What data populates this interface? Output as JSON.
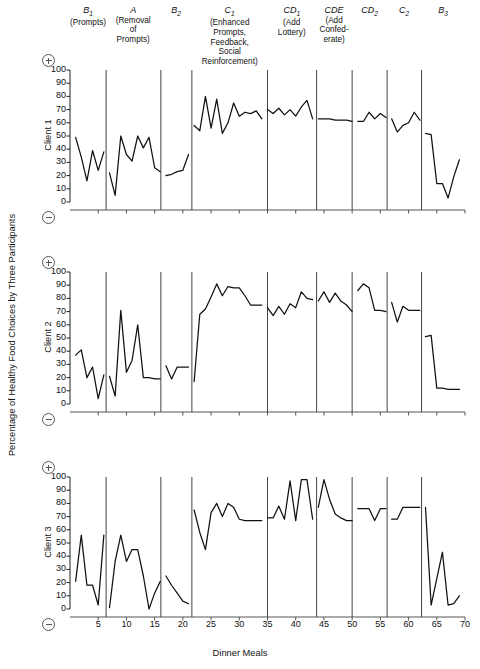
{
  "axes": {
    "ylabel": "Percentage of Healthy Food Choices by Three Participants",
    "xlabel": "Dinner Meals",
    "yticks": [
      0,
      10,
      20,
      30,
      40,
      50,
      60,
      70,
      80,
      90,
      100
    ],
    "xticks": [
      5,
      10,
      15,
      20,
      25,
      30,
      35,
      40,
      45,
      50,
      55,
      60,
      65,
      70
    ],
    "xlim": [
      0,
      70
    ],
    "ylim": [
      0,
      100
    ],
    "positive_symbol": "plus-in-circle",
    "negative_symbol": "minus-in-circle"
  },
  "phases": [
    {
      "code": "B",
      "sub": "1",
      "desc": "(Prompts)",
      "center_x": 3.2,
      "end_x": 6.4
    },
    {
      "code": "A",
      "sub": "",
      "desc": "(Removal\nof\nPrompts)",
      "center_x": 11.2,
      "end_x": 16.1
    },
    {
      "code": "B",
      "sub": "2",
      "desc": "",
      "center_x": 18.8,
      "end_x": 21.6
    },
    {
      "code": "C",
      "sub": "1",
      "desc": "(Enhanced\nPrompts,\nFeedback,\nSocial\nReinforcement)",
      "center_x": 28.3,
      "end_x": 35.0
    },
    {
      "code": "CD",
      "sub": "1",
      "desc": "(Add\nLottery)",
      "center_x": 39.3,
      "end_x": 43.7
    },
    {
      "code": "CDE",
      "sub": "",
      "desc": "(Add\nConfed-\nerate)",
      "center_x": 46.8,
      "end_x": 50.0
    },
    {
      "code": "CD",
      "sub": "2",
      "desc": "",
      "center_x": 53.1,
      "end_x": 56.2
    },
    {
      "code": "C",
      "sub": "2",
      "desc": "",
      "center_x": 59.2,
      "end_x": 62.3
    },
    {
      "code": "B",
      "sub": "3",
      "desc": "",
      "center_x": 66.1,
      "end_x": 70.0
    }
  ],
  "chart_data": [
    {
      "type": "line",
      "title": "Client 1",
      "xlabel": "Dinner Meals",
      "ylabel": "Percentage of Healthy Food Choices",
      "xlim": [
        0,
        70
      ],
      "ylim": [
        0,
        100
      ],
      "grid": false,
      "segments": [
        {
          "phase": "B1",
          "x": [
            1,
            2,
            3,
            4,
            5,
            6
          ],
          "y": [
            49,
            34,
            16,
            39,
            24,
            38
          ]
        },
        {
          "phase": "A",
          "x": [
            7,
            8,
            9,
            10,
            11,
            12,
            13,
            14,
            15,
            16
          ],
          "y": [
            22,
            5,
            50,
            36,
            31,
            50,
            41,
            49,
            26,
            23
          ]
        },
        {
          "phase": "B2",
          "x": [
            17,
            18,
            19,
            20,
            21
          ],
          "y": [
            20,
            21,
            23,
            24,
            36
          ]
        },
        {
          "phase": "C1",
          "x": [
            22,
            23,
            24,
            25,
            26,
            27,
            28,
            29,
            30,
            31,
            32,
            33,
            34
          ],
          "y": [
            58,
            54,
            80,
            56,
            78,
            52,
            60,
            75,
            65,
            68,
            67,
            69,
            63
          ]
        },
        {
          "phase": "CD1",
          "x": [
            35,
            36,
            37,
            38,
            39,
            40,
            41,
            42,
            43
          ],
          "y": [
            70,
            67,
            71,
            66,
            70,
            65,
            72,
            77,
            63
          ]
        },
        {
          "phase": "CDE",
          "x": [
            44,
            45,
            46,
            47,
            48,
            49,
            50
          ],
          "y": [
            63,
            63,
            63,
            62,
            62,
            62,
            61
          ]
        },
        {
          "phase": "CD2",
          "x": [
            51,
            52,
            53,
            54,
            55,
            56
          ],
          "y": [
            61,
            61,
            68,
            63,
            67,
            64
          ]
        },
        {
          "phase": "C2",
          "x": [
            57,
            58,
            59,
            60,
            61,
            62
          ],
          "y": [
            63,
            53,
            58,
            60,
            68,
            62
          ]
        },
        {
          "phase": "B3",
          "x": [
            63,
            64,
            65,
            66,
            67,
            68,
            69
          ],
          "y": [
            52,
            51,
            14,
            14,
            3,
            19,
            32
          ]
        }
      ]
    },
    {
      "type": "line",
      "title": "Client 2",
      "xlabel": "Dinner Meals",
      "ylabel": "Percentage of Healthy Food Choices",
      "xlim": [
        0,
        70
      ],
      "ylim": [
        0,
        100
      ],
      "grid": false,
      "segments": [
        {
          "phase": "B1",
          "x": [
            1,
            2,
            3,
            4,
            5,
            6
          ],
          "y": [
            37,
            41,
            20,
            28,
            4,
            22
          ]
        },
        {
          "phase": "A",
          "x": [
            7,
            8,
            9,
            10,
            11,
            12,
            13,
            14,
            15,
            16
          ],
          "y": [
            21,
            6,
            71,
            24,
            33,
            60,
            20,
            20,
            19,
            19
          ]
        },
        {
          "phase": "B2",
          "x": [
            17,
            18,
            19,
            20,
            21
          ],
          "y": [
            29,
            19,
            28,
            28,
            28
          ]
        },
        {
          "phase": "C1",
          "x": [
            22,
            23,
            24,
            25,
            26,
            27,
            28,
            29,
            30,
            31,
            32,
            33,
            34
          ],
          "y": [
            17,
            68,
            72,
            81,
            91,
            82,
            89,
            88,
            88,
            82,
            75,
            75,
            75
          ]
        },
        {
          "phase": "CD1",
          "x": [
            35,
            36,
            37,
            38,
            39,
            40,
            41,
            42,
            43
          ],
          "y": [
            73,
            67,
            74,
            68,
            76,
            73,
            85,
            80,
            79
          ]
        },
        {
          "phase": "CDE",
          "x": [
            44,
            45,
            46,
            47,
            48,
            49,
            50
          ],
          "y": [
            78,
            85,
            77,
            84,
            78,
            75,
            70
          ]
        },
        {
          "phase": "CD2",
          "x": [
            51,
            52,
            53,
            54,
            55,
            56
          ],
          "y": [
            86,
            91,
            88,
            71,
            71,
            70
          ]
        },
        {
          "phase": "C2",
          "x": [
            57,
            58,
            59,
            60,
            61,
            62
          ],
          "y": [
            77,
            62,
            74,
            71,
            71,
            71
          ]
        },
        {
          "phase": "B3",
          "x": [
            63,
            64,
            65,
            66,
            67,
            68,
            69
          ],
          "y": [
            51,
            52,
            12,
            12,
            11,
            11,
            11
          ]
        }
      ]
    },
    {
      "type": "line",
      "title": "Client 3",
      "xlabel": "Dinner Meals",
      "ylabel": "Percentage of Healthy Food Choices",
      "xlim": [
        0,
        70
      ],
      "ylim": [
        0,
        100
      ],
      "grid": false,
      "segments": [
        {
          "phase": "B1",
          "x": [
            1,
            2,
            3,
            4,
            5,
            6
          ],
          "y": [
            21,
            56,
            18,
            18,
            3,
            56
          ]
        },
        {
          "phase": "A",
          "x": [
            7,
            8,
            9,
            10,
            11,
            12,
            13,
            14,
            15,
            16
          ],
          "y": [
            1,
            36,
            56,
            36,
            45,
            45,
            25,
            0,
            12,
            21
          ]
        },
        {
          "phase": "B2",
          "x": [
            17,
            18,
            19,
            20,
            21
          ],
          "y": [
            25,
            18,
            12,
            6,
            4
          ]
        },
        {
          "phase": "C1",
          "x": [
            22,
            23,
            24,
            25,
            26,
            27,
            28,
            29,
            30,
            31,
            32,
            33,
            34
          ],
          "y": [
            75,
            58,
            45,
            73,
            80,
            70,
            80,
            77,
            68,
            67,
            67,
            67,
            67
          ]
        },
        {
          "phase": "CD1",
          "x": [
            35,
            36,
            37,
            38,
            39,
            40,
            41,
            42,
            43
          ],
          "y": [
            69,
            69,
            78,
            68,
            97,
            67,
            98,
            98,
            68
          ]
        },
        {
          "phase": "CDE",
          "x": [
            44,
            45,
            46,
            47,
            48,
            49,
            50
          ],
          "y": [
            77,
            98,
            83,
            72,
            69,
            67,
            67
          ]
        },
        {
          "phase": "CD2",
          "x": [
            51,
            52,
            53,
            54,
            55,
            56
          ],
          "y": [
            76,
            76,
            76,
            67,
            76,
            76
          ]
        },
        {
          "phase": "C2",
          "x": [
            57,
            58,
            59,
            60,
            61,
            62
          ],
          "y": [
            68,
            68,
            77,
            77,
            77,
            77
          ]
        },
        {
          "phase": "B3",
          "x": [
            63,
            64,
            65,
            66,
            67,
            68,
            69
          ],
          "y": [
            77,
            3,
            23,
            43,
            3,
            4,
            10
          ]
        }
      ]
    }
  ]
}
